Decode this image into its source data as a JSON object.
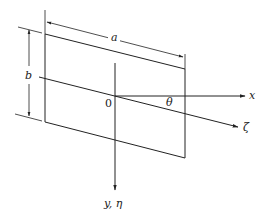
{
  "diagram": {
    "labels": {
      "a": "a",
      "b": "b",
      "origin": "0",
      "theta": "θ",
      "x_axis": "x",
      "zeta_axis": "ζ",
      "y_axis": "y, η"
    },
    "colors": {
      "line": "#222222",
      "background": "#ffffff"
    }
  }
}
